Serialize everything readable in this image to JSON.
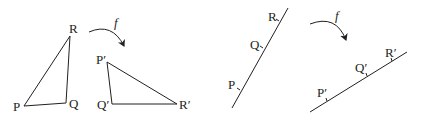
{
  "diagram": {
    "left_panel": {
      "original_triangle": {
        "vertices": [
          {
            "label": "P",
            "x": 24,
            "y": 106,
            "lx": 13,
            "ly": 111
          },
          {
            "label": "Q",
            "x": 66,
            "y": 103,
            "lx": 70,
            "ly": 108
          },
          {
            "label": "R",
            "x": 70,
            "y": 36,
            "lx": 70,
            "ly": 33
          }
        ]
      },
      "map_label": "f",
      "image_triangle": {
        "vertices": [
          {
            "label": "P′",
            "x": 107,
            "y": 62,
            "lx": 97,
            "ly": 63
          },
          {
            "label": "Q′",
            "x": 112,
            "y": 104,
            "lx": 98,
            "ly": 109
          },
          {
            "label": "R′",
            "x": 177,
            "y": 104,
            "lx": 180,
            "ly": 109
          }
        ]
      }
    },
    "right_panel": {
      "original_line": {
        "points": [
          {
            "label": "P",
            "lx": 227,
            "ly": 86
          },
          {
            "label": "Q",
            "lx": 250,
            "ly": 48
          },
          {
            "label": "R",
            "lx": 268,
            "ly": 21
          }
        ]
      },
      "map_label": "f",
      "image_line": {
        "points": [
          {
            "label": "P′",
            "lx": 318,
            "ly": 98
          },
          {
            "label": "Q′",
            "lx": 355,
            "ly": 72
          },
          {
            "label": "R′",
            "lx": 386,
            "ly": 58
          }
        ]
      }
    }
  }
}
